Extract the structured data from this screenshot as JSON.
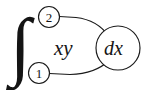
{
  "figure": {
    "kind": "math-expression-diagram",
    "background_color": "#ffffff",
    "ink_color": "#1a1a1a",
    "expression": "∫ xy dx",
    "integral_symbol": "∫",
    "integrand": "xy",
    "differential": "dx",
    "upper_limit": "2",
    "lower_limit": "1",
    "upper_limit_marker": "②",
    "lower_limit_marker": "①"
  },
  "nodes": {
    "upper_limit_node": {
      "label": "2",
      "cx": 49,
      "cy": 17,
      "r": 10.5
    },
    "lower_limit_node": {
      "label": "1",
      "cx": 39,
      "cy": 73,
      "r": 10.5
    },
    "differential_node": {
      "label": "dx",
      "cx": 118,
      "cy": 48,
      "rx": 22,
      "ry": 22
    }
  },
  "edges": [
    {
      "name": "upper-limit-to-differential",
      "from": "upper_limit_node",
      "to": "differential_node",
      "path": "M 59.5 16.5 L 76 17.5 C 93 19.5 103 28 108.5 36"
    },
    {
      "name": "lower-limit-to-differential",
      "from": "lower_limit_node",
      "to": "differential_node",
      "path": "M 49.5 73.5 L 70 74.5 C 88 74 101 68.5 109.5 60"
    }
  ],
  "integral_symbol_position": {
    "x": 10,
    "y": 71
  },
  "integrand_position": {
    "x": 54,
    "y": 55
  },
  "differential_position": {
    "x": 104,
    "y": 55
  }
}
